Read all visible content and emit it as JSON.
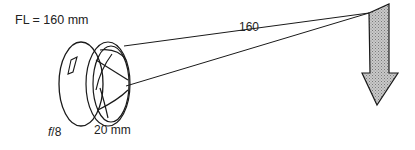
{
  "diagram": {
    "focal_length_label": "FL = 160 mm",
    "distance_label": "160",
    "aperture_diameter_label": "20 mm",
    "f_number_prefix": "f",
    "f_number_value": "/8"
  },
  "colors": {
    "line": "#1a1a1a",
    "arrow_fill": "#b0b0b0"
  }
}
